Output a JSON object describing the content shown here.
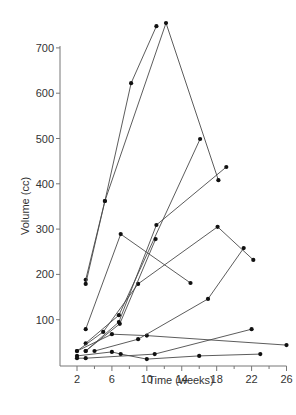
{
  "chart_data": {
    "type": "line",
    "title": "",
    "xlabel": "Time (weeks)",
    "ylabel": "Volume (cc)",
    "xlim": [
      2,
      26
    ],
    "ylim": [
      0,
      700
    ],
    "xticks": [
      2,
      6,
      10,
      14,
      18,
      22,
      26
    ],
    "xminor_ticks": [
      4,
      8,
      12,
      16,
      20,
      24
    ],
    "yticks": [
      100,
      200,
      300,
      400,
      500,
      600,
      700
    ],
    "grid": false,
    "legend": null,
    "line_color": "#4a4a4a",
    "marker_color": "#111111",
    "series": [
      {
        "name": "1",
        "points": [
          [
            3,
            188
          ],
          [
            5.2,
            362
          ],
          [
            8.2,
            622
          ],
          [
            11.1,
            748
          ]
        ]
      },
      {
        "name": "2",
        "points": [
          [
            3,
            179
          ],
          [
            5.2,
            362
          ],
          [
            12.2,
            755
          ],
          [
            18.2,
            408
          ]
        ]
      },
      {
        "name": "3",
        "points": [
          [
            3,
            79
          ],
          [
            7,
            289
          ],
          [
            15,
            181
          ]
        ]
      },
      {
        "name": "4",
        "points": [
          [
            3,
            48
          ],
          [
            6.8,
            110
          ],
          [
            16.1,
            499
          ]
        ]
      },
      {
        "name": "5",
        "points": [
          [
            2,
            31
          ],
          [
            5,
            73
          ],
          [
            9,
            179
          ],
          [
            18.1,
            305
          ],
          [
            22.2,
            232
          ]
        ]
      },
      {
        "name": "6",
        "points": [
          [
            3,
            31
          ],
          [
            6.8,
            95
          ],
          [
            11.1,
            309
          ],
          [
            19.1,
            437
          ]
        ]
      },
      {
        "name": "7",
        "points": [
          [
            3,
            31
          ],
          [
            6.9,
            91
          ],
          [
            11,
            278
          ]
        ]
      },
      {
        "name": "8",
        "points": [
          [
            2,
            31
          ],
          [
            6,
            68
          ],
          [
            10,
            65
          ],
          [
            26,
            44
          ]
        ]
      },
      {
        "name": "9",
        "points": [
          [
            4,
            31
          ],
          [
            9,
            57
          ],
          [
            17,
            146
          ],
          [
            21.1,
            258
          ]
        ]
      },
      {
        "name": "10",
        "points": [
          [
            2,
            20
          ],
          [
            6,
            29
          ],
          [
            7,
            24
          ],
          [
            10,
            13
          ],
          [
            16,
            20
          ],
          [
            23,
            24
          ]
        ]
      },
      {
        "name": "11",
        "points": [
          [
            2,
            15
          ],
          [
            3,
            15
          ],
          [
            10.9,
            24
          ],
          [
            22,
            79
          ]
        ]
      }
    ]
  }
}
